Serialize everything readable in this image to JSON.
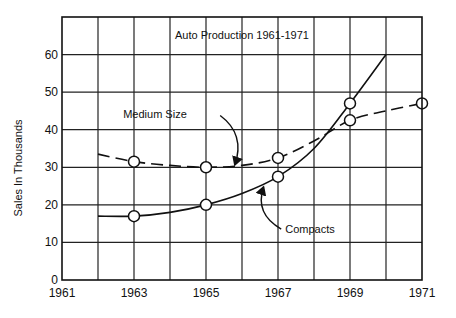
{
  "chart_data": {
    "type": "line",
    "title": "Auto Production  1961-1971",
    "xlabel": "",
    "ylabel": "Sales In  Thousands",
    "xlim": [
      1961,
      1971
    ],
    "ylim": [
      0,
      70
    ],
    "x_ticks": [
      1961,
      1963,
      1965,
      1967,
      1969,
      1971
    ],
    "x_tick_labels": [
      "1961",
      "1963",
      "1965",
      "1967",
      "1969",
      "1971"
    ],
    "y_ticks": [
      0,
      10,
      20,
      30,
      40,
      50,
      60
    ],
    "y_tick_labels": [
      "0",
      "10",
      "20",
      "30",
      "40",
      "50",
      "60"
    ],
    "x_grid_step": 1,
    "y_grid_step": 10,
    "grid": true,
    "legend": "none (inline annotations)",
    "series": [
      {
        "name": "Medium Size",
        "style": "dashed",
        "marker_points": [
          {
            "x": 1963,
            "y": 31.5
          },
          {
            "x": 1965,
            "y": 30
          },
          {
            "x": 1967,
            "y": 32.5
          },
          {
            "x": 1969,
            "y": 42.5
          },
          {
            "x": 1971,
            "y": 47
          }
        ],
        "curve": [
          {
            "x": 1962,
            "y": 33.5
          },
          {
            "x": 1963,
            "y": 31.5
          },
          {
            "x": 1964,
            "y": 30.5
          },
          {
            "x": 1965,
            "y": 30
          },
          {
            "x": 1966,
            "y": 30.5
          },
          {
            "x": 1967,
            "y": 32.5
          },
          {
            "x": 1968,
            "y": 37
          },
          {
            "x": 1969,
            "y": 42.5
          },
          {
            "x": 1970,
            "y": 45
          },
          {
            "x": 1971,
            "y": 47
          }
        ]
      },
      {
        "name": "Compacts",
        "style": "solid",
        "marker_points": [
          {
            "x": 1963,
            "y": 17
          },
          {
            "x": 1965,
            "y": 20
          },
          {
            "x": 1967,
            "y": 27.5
          },
          {
            "x": 1969,
            "y": 47
          }
        ],
        "curve": [
          {
            "x": 1962,
            "y": 17
          },
          {
            "x": 1963,
            "y": 17
          },
          {
            "x": 1964,
            "y": 18
          },
          {
            "x": 1965,
            "y": 20
          },
          {
            "x": 1966,
            "y": 23
          },
          {
            "x": 1967,
            "y": 27.5
          },
          {
            "x": 1968,
            "y": 35
          },
          {
            "x": 1969,
            "y": 47
          },
          {
            "x": 1970,
            "y": 60
          }
        ]
      }
    ],
    "annotations": [
      {
        "text": "Medium Size",
        "label_at": {
          "x": 1962.7,
          "y": 43
        },
        "arrow_to": {
          "x": 1965.8,
          "y": 30.6
        }
      },
      {
        "text": "Compacts",
        "label_at": {
          "x": 1967.2,
          "y": 12.5
        },
        "arrow_to": {
          "x": 1966.6,
          "y": 24.8
        }
      }
    ]
  }
}
